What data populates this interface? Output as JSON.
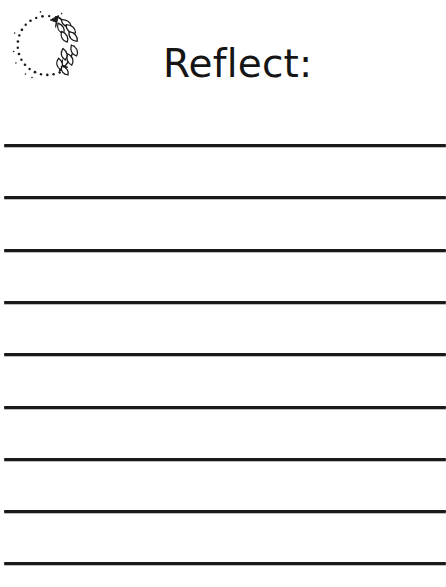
{
  "page": {
    "background_color": "#ffffff",
    "width": 446,
    "height": 587,
    "kind": "printable-journal-worksheet"
  },
  "header": {
    "title": "Reflect:",
    "title_color": "#151515",
    "ornament": {
      "icon_name": "laurel-wreath-icon",
      "description": "dotted circle wreath with two leafy laurel branches on the right side",
      "stroke_color": "#1a1a1a",
      "fill_color": "#ffffff"
    }
  },
  "writing_area": {
    "line_color": "#1a1a1a",
    "line_count": 9,
    "line_thickness_px": 3,
    "line_spacing_px": 52,
    "lines": [
      {
        "index": 1,
        "y": 144,
        "value": "",
        "placeholder": ""
      },
      {
        "index": 2,
        "y": 196,
        "value": "",
        "placeholder": ""
      },
      {
        "index": 3,
        "y": 249,
        "value": "",
        "placeholder": ""
      },
      {
        "index": 4,
        "y": 301,
        "value": "",
        "placeholder": ""
      },
      {
        "index": 5,
        "y": 353,
        "value": "",
        "placeholder": ""
      },
      {
        "index": 6,
        "y": 406,
        "value": "",
        "placeholder": ""
      },
      {
        "index": 7,
        "y": 458,
        "value": "",
        "placeholder": ""
      },
      {
        "index": 8,
        "y": 510,
        "value": "",
        "placeholder": ""
      },
      {
        "index": 9,
        "y": 562,
        "value": "",
        "placeholder": ""
      }
    ]
  }
}
